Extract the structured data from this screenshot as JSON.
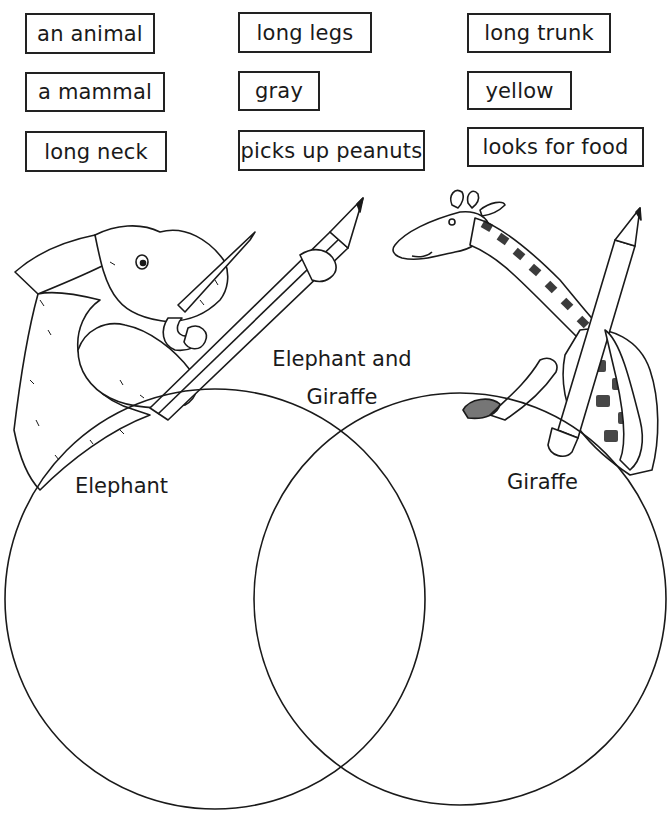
{
  "word_bank": [
    {
      "id": "an-animal",
      "text": "an animal",
      "x": 25,
      "y": 13,
      "w": 130,
      "h": 41
    },
    {
      "id": "long-legs",
      "text": "long legs",
      "x": 238,
      "y": 12,
      "w": 134,
      "h": 41
    },
    {
      "id": "long-trunk",
      "text": "long trunk",
      "x": 467,
      "y": 13,
      "w": 144,
      "h": 40
    },
    {
      "id": "a-mammal",
      "text": "a mammal",
      "x": 25,
      "y": 72,
      "w": 140,
      "h": 40
    },
    {
      "id": "gray",
      "text": "gray",
      "x": 238,
      "y": 71,
      "w": 82,
      "h": 40
    },
    {
      "id": "yellow",
      "text": "yellow",
      "x": 467,
      "y": 71,
      "w": 105,
      "h": 39
    },
    {
      "id": "long-neck",
      "text": "long neck",
      "x": 25,
      "y": 131,
      "w": 142,
      "h": 41
    },
    {
      "id": "picks-up-peanuts",
      "text": "picks up peanuts",
      "x": 238,
      "y": 130,
      "w": 187,
      "h": 41
    },
    {
      "id": "looks-for-food",
      "text": "looks for food",
      "x": 467,
      "y": 127,
      "w": 177,
      "h": 40
    }
  ],
  "venn": {
    "left": {
      "label": "Elephant",
      "cx": 215,
      "cy": 599,
      "r": 210
    },
    "right": {
      "label": "Giraffe",
      "cx": 460,
      "cy": 599,
      "r": 206
    },
    "overlap": {
      "label_line1": "Elephant and",
      "label_line2": "Giraffe"
    }
  },
  "illustrations": {
    "left": "elephant holding pencil",
    "right": "giraffe holding pencil"
  },
  "colors": {
    "ink": "#1a1a1a",
    "background": "#ffffff"
  }
}
